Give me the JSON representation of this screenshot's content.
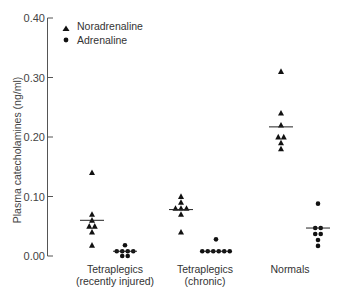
{
  "chart_data": {
    "type": "scatter",
    "subtype": "dot-strip-plot-with-medians",
    "title": "",
    "xlabel": "",
    "ylabel": "Plasma catecholamines (ng/ml)",
    "ylim": [
      0,
      0.4
    ],
    "yticks": [
      0.0,
      0.1,
      0.2,
      0.3,
      0.4
    ],
    "ytick_labels": [
      "0.00",
      "0.10",
      "0.20",
      "0.30",
      "0.40"
    ],
    "grid": false,
    "legend_position": "top-left",
    "categories": [
      "Tetraplegics\n(recently injured)",
      "Tetraplegics\n(chronic)",
      "Normals"
    ],
    "series": [
      {
        "name": "Noradrenaline",
        "marker": "triangle",
        "values": [
          [
            0.14,
            0.07,
            0.06,
            0.05,
            0.05,
            0.04,
            0.018
          ],
          [
            0.1,
            0.09,
            0.08,
            0.08,
            0.08,
            0.07,
            0.04
          ],
          [
            0.31,
            0.24,
            0.22,
            0.2,
            0.2,
            0.19,
            0.18
          ]
        ],
        "medians": [
          0.06,
          0.078,
          0.217
        ]
      },
      {
        "name": "Adrenaline",
        "marker": "circle",
        "values": [
          [
            0.018,
            0.008,
            0.008,
            0.008,
            0.008,
            0.0,
            0.0
          ],
          [
            0.028,
            0.008,
            0.008,
            0.008,
            0.008,
            0.008,
            0.008
          ],
          [
            0.088,
            0.047,
            0.047,
            0.037,
            0.037,
            0.027,
            0.017
          ]
        ],
        "medians": [
          0.008,
          0.008,
          0.047
        ]
      }
    ]
  },
  "labels": {
    "cat1_line1": "Tetraplegics",
    "cat1_line2": "(recently injured)",
    "cat2_line1": "Tetraplegics",
    "cat2_line2": "(chronic)",
    "cat3_line1": "Normals",
    "legend_nor": "Noradrenaline",
    "legend_adr": "Adrenaline"
  }
}
